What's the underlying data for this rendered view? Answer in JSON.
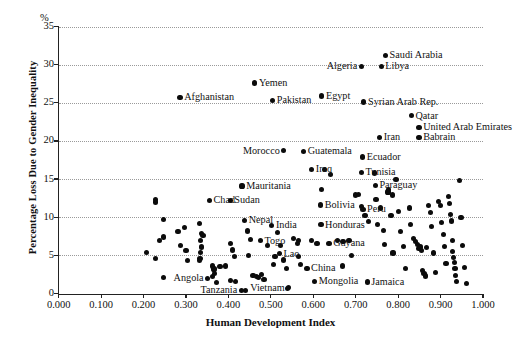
{
  "chart_data": {
    "type": "scatter",
    "title": "",
    "xlabel": "Human Development Index",
    "ylabel": "Percentage Loss Due to Gender Inequality",
    "yunit": "%",
    "xlim": [
      0.0,
      1.0
    ],
    "ylim": [
      0,
      35
    ],
    "xticks": [
      "0.000",
      "0.100",
      "0.200",
      "0.300",
      "0.400",
      "0.500",
      "0.600",
      "0.700",
      "0.800",
      "0.900",
      "1.000"
    ],
    "xtick_values": [
      0.0,
      0.1,
      0.2,
      0.3,
      0.4,
      0.5,
      0.6,
      0.7,
      0.8,
      0.9,
      1.0
    ],
    "yticks": [
      "0",
      "5",
      "10",
      "15",
      "20",
      "25",
      "30",
      "35"
    ],
    "ytick_values": [
      0,
      5,
      10,
      15,
      20,
      25,
      30,
      35
    ],
    "grid": "horizontal-dotted",
    "legend": "none",
    "labeled_points": [
      {
        "label": "Saudi Arabia",
        "x": 0.77,
        "y": 31.2,
        "side": "right"
      },
      {
        "label": "Algeria",
        "x": 0.713,
        "y": 29.8,
        "side": "left"
      },
      {
        "label": "Libya",
        "x": 0.76,
        "y": 29.8,
        "side": "right"
      },
      {
        "label": "Yemen",
        "x": 0.462,
        "y": 27.6,
        "side": "right"
      },
      {
        "label": "Afghanistan",
        "x": 0.286,
        "y": 25.7,
        "side": "right"
      },
      {
        "label": "Pakistan",
        "x": 0.504,
        "y": 25.3,
        "side": "right"
      },
      {
        "label": "Egypt",
        "x": 0.62,
        "y": 25.9,
        "side": "right"
      },
      {
        "label": "Syrian Arab Rep.",
        "x": 0.719,
        "y": 25.1,
        "side": "right"
      },
      {
        "label": "Qatar",
        "x": 0.831,
        "y": 23.3,
        "side": "right"
      },
      {
        "label": "United Arab Emirates",
        "x": 0.849,
        "y": 21.8,
        "side": "right"
      },
      {
        "label": "Iran",
        "x": 0.756,
        "y": 20.5,
        "side": "right"
      },
      {
        "label": "Babrain",
        "x": 0.849,
        "y": 20.5,
        "side": "right"
      },
      {
        "label": "Morocco",
        "x": 0.53,
        "y": 18.7,
        "side": "left"
      },
      {
        "label": "Guatemala",
        "x": 0.577,
        "y": 18.6,
        "side": "right"
      },
      {
        "label": "Ecuador",
        "x": 0.716,
        "y": 17.9,
        "side": "right"
      },
      {
        "label": "Tunisia",
        "x": 0.713,
        "y": 15.9,
        "side": "right"
      },
      {
        "label": "Iraq",
        "x": 0.596,
        "y": 16.3,
        "side": "right"
      },
      {
        "label": "Mauritania",
        "x": 0.432,
        "y": 14.1,
        "side": "right"
      },
      {
        "label": "Paraguay",
        "x": 0.746,
        "y": 14.2,
        "side": "right"
      },
      {
        "label": "Chad",
        "x": 0.355,
        "y": 12.2,
        "side": "right"
      },
      {
        "label": "Sudan",
        "x": 0.404,
        "y": 12.2,
        "side": "right"
      },
      {
        "label": "Bolivia",
        "x": 0.617,
        "y": 11.6,
        "side": "right"
      },
      {
        "label": "Peru",
        "x": 0.717,
        "y": 11.0,
        "side": "right"
      },
      {
        "label": "Nepal",
        "x": 0.438,
        "y": 9.6,
        "side": "right"
      },
      {
        "label": "India",
        "x": 0.502,
        "y": 8.9,
        "side": "right"
      },
      {
        "label": "Honduras",
        "x": 0.618,
        "y": 9.0,
        "side": "right"
      },
      {
        "label": "Togo",
        "x": 0.475,
        "y": 6.9,
        "side": "right"
      },
      {
        "label": "Lao",
        "x": 0.52,
        "y": 5.2,
        "side": "right"
      },
      {
        "label": "Guyana",
        "x": 0.637,
        "y": 6.6,
        "side": "right"
      },
      {
        "label": "Angola",
        "x": 0.35,
        "y": 2.0,
        "side": "left"
      },
      {
        "label": "Tanzania",
        "x": 0.43,
        "y": 0.4,
        "side": "left"
      },
      {
        "label": "Vietnam",
        "x": 0.54,
        "y": 0.7,
        "side": "left"
      },
      {
        "label": "China",
        "x": 0.585,
        "y": 3.3,
        "side": "right"
      },
      {
        "label": "Mongolia",
        "x": 0.603,
        "y": 1.6,
        "side": "right"
      },
      {
        "label": "Jamaica",
        "x": 0.727,
        "y": 1.5,
        "side": "right"
      }
    ],
    "unlabeled_points": [
      {
        "x": 0.228,
        "y": 12.3
      },
      {
        "x": 0.229,
        "y": 12.0
      },
      {
        "x": 0.247,
        "y": 9.7
      },
      {
        "x": 0.238,
        "y": 6.9
      },
      {
        "x": 0.247,
        "y": 7.4
      },
      {
        "x": 0.206,
        "y": 5.4
      },
      {
        "x": 0.228,
        "y": 4.6
      },
      {
        "x": 0.281,
        "y": 8.1
      },
      {
        "x": 0.296,
        "y": 8.6
      },
      {
        "x": 0.288,
        "y": 6.3
      },
      {
        "x": 0.3,
        "y": 5.6
      },
      {
        "x": 0.303,
        "y": 4.3
      },
      {
        "x": 0.332,
        "y": 9.2
      },
      {
        "x": 0.337,
        "y": 7.9
      },
      {
        "x": 0.34,
        "y": 7.6
      },
      {
        "x": 0.334,
        "y": 6.9
      },
      {
        "x": 0.336,
        "y": 6.1
      },
      {
        "x": 0.335,
        "y": 5.4
      },
      {
        "x": 0.333,
        "y": 4.6
      },
      {
        "x": 0.331,
        "y": 4.3
      },
      {
        "x": 0.362,
        "y": 3.6
      },
      {
        "x": 0.366,
        "y": 3.2
      },
      {
        "x": 0.368,
        "y": 2.6
      },
      {
        "x": 0.363,
        "y": 2.2
      },
      {
        "x": 0.372,
        "y": 1.4
      },
      {
        "x": 0.38,
        "y": 3.5
      },
      {
        "x": 0.393,
        "y": 3.6
      },
      {
        "x": 0.404,
        "y": 6.6
      },
      {
        "x": 0.41,
        "y": 5.7
      },
      {
        "x": 0.414,
        "y": 4.8
      },
      {
        "x": 0.404,
        "y": 1.7
      },
      {
        "x": 0.417,
        "y": 1.6
      },
      {
        "x": 0.445,
        "y": 8.2
      },
      {
        "x": 0.452,
        "y": 7.1
      },
      {
        "x": 0.447,
        "y": 5.0
      },
      {
        "x": 0.458,
        "y": 2.4
      },
      {
        "x": 0.466,
        "y": 2.2
      },
      {
        "x": 0.47,
        "y": 2.1
      },
      {
        "x": 0.478,
        "y": 2.5
      },
      {
        "x": 0.484,
        "y": 1.8
      },
      {
        "x": 0.492,
        "y": 6.3
      },
      {
        "x": 0.51,
        "y": 4.9
      },
      {
        "x": 0.506,
        "y": 3.8
      },
      {
        "x": 0.515,
        "y": 8.0
      },
      {
        "x": 0.523,
        "y": 6.3
      },
      {
        "x": 0.529,
        "y": 4.4
      },
      {
        "x": 0.537,
        "y": 3.3
      },
      {
        "x": 0.541,
        "y": 0.8
      },
      {
        "x": 0.553,
        "y": 7.2
      },
      {
        "x": 0.563,
        "y": 6.6
      },
      {
        "x": 0.566,
        "y": 4.9
      },
      {
        "x": 0.57,
        "y": 3.8
      },
      {
        "x": 0.566,
        "y": 7.0
      },
      {
        "x": 0.596,
        "y": 6.9
      },
      {
        "x": 0.609,
        "y": 6.6
      },
      {
        "x": 0.62,
        "y": 13.6
      },
      {
        "x": 0.626,
        "y": 16.3
      },
      {
        "x": 0.64,
        "y": 15.6
      },
      {
        "x": 0.657,
        "y": 6.9
      },
      {
        "x": 0.67,
        "y": 6.8
      },
      {
        "x": 0.668,
        "y": 3.6
      },
      {
        "x": 0.684,
        "y": 7.0
      },
      {
        "x": 0.691,
        "y": 5.0
      },
      {
        "x": 0.7,
        "y": 12.9
      },
      {
        "x": 0.706,
        "y": 13.0
      },
      {
        "x": 0.713,
        "y": 11.4
      },
      {
        "x": 0.722,
        "y": 10.2
      },
      {
        "x": 0.731,
        "y": 9.4
      },
      {
        "x": 0.745,
        "y": 15.8
      },
      {
        "x": 0.748,
        "y": 12.3
      },
      {
        "x": 0.752,
        "y": 9.0
      },
      {
        "x": 0.758,
        "y": 11.2
      },
      {
        "x": 0.766,
        "y": 8.3
      },
      {
        "x": 0.767,
        "y": 6.4
      },
      {
        "x": 0.776,
        "y": 13.3
      },
      {
        "x": 0.778,
        "y": 13.6
      },
      {
        "x": 0.783,
        "y": 10.2
      },
      {
        "x": 0.786,
        "y": 12.9
      },
      {
        "x": 0.788,
        "y": 5.3
      },
      {
        "x": 0.795,
        "y": 14.9
      },
      {
        "x": 0.8,
        "y": 10.8
      },
      {
        "x": 0.806,
        "y": 8.1
      },
      {
        "x": 0.812,
        "y": 6.2
      },
      {
        "x": 0.818,
        "y": 3.3
      },
      {
        "x": 0.826,
        "y": 11.2
      },
      {
        "x": 0.83,
        "y": 9.0
      },
      {
        "x": 0.836,
        "y": 7.2
      },
      {
        "x": 0.84,
        "y": 6.8
      },
      {
        "x": 0.845,
        "y": 6.4
      },
      {
        "x": 0.849,
        "y": 5.9
      },
      {
        "x": 0.852,
        "y": 6.1
      },
      {
        "x": 0.856,
        "y": 5.6
      },
      {
        "x": 0.858,
        "y": 3.0
      },
      {
        "x": 0.861,
        "y": 2.6
      },
      {
        "x": 0.864,
        "y": 2.3
      },
      {
        "x": 0.867,
        "y": 6.0
      },
      {
        "x": 0.872,
        "y": 11.5
      },
      {
        "x": 0.876,
        "y": 10.6
      },
      {
        "x": 0.879,
        "y": 8.8
      },
      {
        "x": 0.884,
        "y": 5.3
      },
      {
        "x": 0.888,
        "y": 2.8
      },
      {
        "x": 0.895,
        "y": 12.1
      },
      {
        "x": 0.899,
        "y": 11.5
      },
      {
        "x": 0.902,
        "y": 9.3
      },
      {
        "x": 0.906,
        "y": 7.7
      },
      {
        "x": 0.91,
        "y": 6.2
      },
      {
        "x": 0.913,
        "y": 3.9
      },
      {
        "x": 0.918,
        "y": 12.7
      },
      {
        "x": 0.921,
        "y": 11.8
      },
      {
        "x": 0.924,
        "y": 10.4
      },
      {
        "x": 0.926,
        "y": 9.5
      },
      {
        "x": 0.928,
        "y": 7.0
      },
      {
        "x": 0.929,
        "y": 5.5
      },
      {
        "x": 0.931,
        "y": 4.7
      },
      {
        "x": 0.933,
        "y": 4.1
      },
      {
        "x": 0.934,
        "y": 3.3
      },
      {
        "x": 0.936,
        "y": 2.4
      },
      {
        "x": 0.938,
        "y": 1.6
      },
      {
        "x": 0.944,
        "y": 14.8
      },
      {
        "x": 0.948,
        "y": 10.0
      },
      {
        "x": 0.952,
        "y": 6.3
      },
      {
        "x": 0.956,
        "y": 3.4
      },
      {
        "x": 0.962,
        "y": 1.3
      },
      {
        "x": 0.44,
        "y": 0.4
      },
      {
        "x": 0.247,
        "y": 2.1
      }
    ]
  }
}
